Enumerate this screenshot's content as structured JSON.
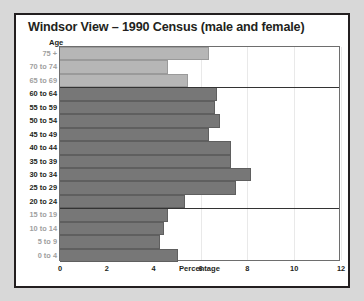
{
  "chart_data": {
    "type": "bar",
    "orientation": "horizontal",
    "title": "Windsor View – 1990 Census (male and female)",
    "xlabel": "Percentage",
    "ylabel": "Age",
    "xlim": [
      0,
      12
    ],
    "xticks": [
      0,
      2,
      4,
      6,
      8,
      10,
      12
    ],
    "xtick_labels": [
      "0",
      "2",
      "4",
      "6",
      "8",
      "10",
      "12"
    ],
    "grid": true,
    "legend": null,
    "categories": [
      "75 +",
      "70 to 74",
      "65 to 69",
      "60 to 64",
      "55 to 59",
      "50 to 54",
      "45 to 49",
      "40 to 44",
      "35 to 39",
      "30 to 34",
      "25 to 29",
      "20 to 24",
      "15 to 19",
      "10 to 14",
      "5 to 9",
      "0 to 4"
    ],
    "values": [
      6.35,
      4.6,
      5.45,
      6.7,
      6.6,
      6.85,
      6.35,
      7.3,
      7.3,
      8.15,
      7.5,
      5.35,
      4.6,
      4.45,
      4.25,
      5.05
    ],
    "bar_colors": [
      "#b6b6b6",
      "#b6b6b6",
      "#b6b6b6",
      "#777777",
      "#777777",
      "#777777",
      "#777777",
      "#777777",
      "#777777",
      "#777777",
      "#777777",
      "#777777",
      "#777777",
      "#777777",
      "#777777",
      "#777777"
    ],
    "label_colors": [
      "grey",
      "grey",
      "grey",
      "black",
      "black",
      "black",
      "black",
      "black",
      "black",
      "black",
      "black",
      "black",
      "grey",
      "grey",
      "grey",
      "grey"
    ],
    "separators_after": [
      2,
      11
    ]
  },
  "colors": {
    "page_background": "#d8d8d8",
    "panel_background": "#ffffff",
    "panel_border": "#231f20",
    "text": "#231f20",
    "muted_text": "#a0a0a0",
    "bar_light": "#b6b6b6",
    "bar_dark": "#777777",
    "gridline": "#e9e9e9"
  }
}
